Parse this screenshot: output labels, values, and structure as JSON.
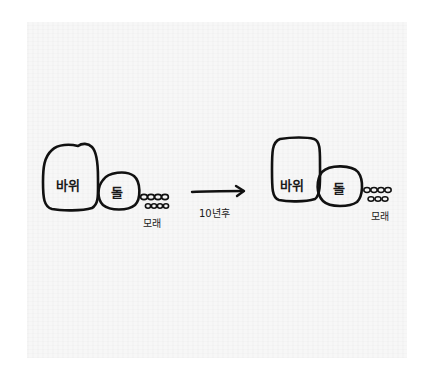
{
  "diagram": {
    "title": "",
    "colors": {
      "ink": "#111111",
      "paper": "#f7f7f7",
      "background": "#ffffff"
    },
    "before": {
      "rock_label": "바위",
      "stone_label": "돌",
      "sand_label": "모래"
    },
    "transition": {
      "label": "10년후",
      "arrow": "right-arrow"
    },
    "after": {
      "rock_label": "바위",
      "stone_label": "돌",
      "sand_label": "모래"
    }
  }
}
